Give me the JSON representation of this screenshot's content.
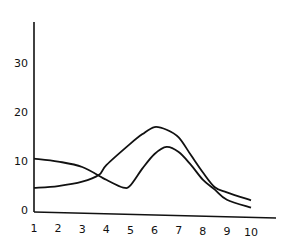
{
  "chart_data": {
    "type": "line",
    "title": "",
    "xlabel": "",
    "ylabel": "",
    "xlim": [
      1,
      10
    ],
    "ylim": [
      0,
      35
    ],
    "grid": false,
    "legend": null,
    "x_ticks": [
      "1",
      "2",
      "3",
      "4",
      "5",
      "6",
      "7",
      "8",
      "9",
      "10"
    ],
    "y_ticks": [
      "0",
      "10",
      "20",
      "30"
    ],
    "series": [
      {
        "name": "curve-a",
        "x": [
          1,
          2,
          3,
          4,
          4.7,
          5,
          5.5,
          6,
          6.5,
          7,
          7.5,
          8,
          8.5,
          9,
          10
        ],
        "values": [
          10.5,
          10,
          9,
          6.5,
          5,
          5.5,
          9,
          12,
          13.5,
          12.5,
          10,
          7,
          5,
          3,
          1.5
        ]
      },
      {
        "name": "curve-b",
        "x": [
          1,
          2,
          3,
          3.7,
          4,
          5,
          5.5,
          6,
          6.5,
          7,
          7.5,
          8,
          8.5,
          9,
          10
        ],
        "values": [
          4.5,
          5,
          6,
          7.5,
          9.5,
          14,
          16,
          17.5,
          17,
          15.5,
          12,
          8.5,
          5.5,
          4.5,
          3
        ]
      }
    ],
    "colors": {
      "line": "#111111",
      "axis": "#111111"
    }
  }
}
